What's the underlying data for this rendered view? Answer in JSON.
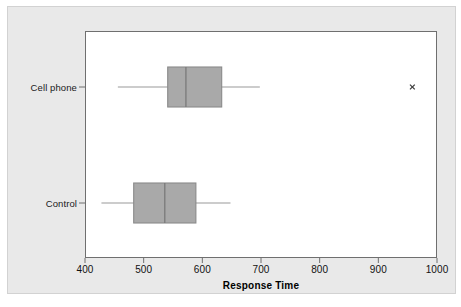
{
  "chart_data": {
    "type": "boxplot",
    "title": "",
    "subtitle": "",
    "xlabel": "Response Time",
    "ylabel": "",
    "orientation": "horizontal",
    "xlim": [
      380,
      1020
    ],
    "xticks": [
      400,
      500,
      600,
      700,
      800,
      900,
      1000
    ],
    "xtick_labels": [
      "400",
      "500",
      "600",
      "700",
      "800",
      "900",
      "1000"
    ],
    "grid": false,
    "legend": null,
    "categories": [
      "Cell phone",
      "Control"
    ],
    "boxes": [
      {
        "label": "Cell phone",
        "whisker_low": 456,
        "q1": 541,
        "median": 572,
        "q3": 633,
        "whisker_high": 698,
        "outliers": [
          958
        ]
      },
      {
        "label": "Control",
        "whisker_low": 428,
        "q1": 483,
        "median": 536,
        "q3": 589,
        "whisker_high": 648,
        "outliers": []
      }
    ],
    "colors": {
      "box_fill": "#a9a9a9",
      "box_edge": "#8a8a8a",
      "median_line": "#7a7a7a",
      "whisker_line": "#9a9a9a",
      "outlier_marker": "#3a3a3a",
      "panel_background": "#ffffff",
      "figure_background": "#e9e9e9",
      "axis_line": "#6f6f6f",
      "text": "#111111"
    }
  },
  "axis": {
    "x_title": "Response Time"
  }
}
